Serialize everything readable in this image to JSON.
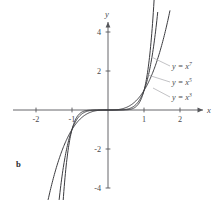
{
  "figure": {
    "panel_label": "b",
    "axis_x_name": "x",
    "axis_y_name": "y"
  },
  "chart_data": {
    "type": "line",
    "title": "",
    "subtitle": "",
    "xlabel": "x",
    "ylabel": "y",
    "xlim": [
      -2.6,
      2.45
    ],
    "ylim": [
      -5.2,
      5.1
    ],
    "grid": false,
    "legend_position": "right-inside",
    "xticks": [
      -2,
      -1,
      1,
      2
    ],
    "xtick_labels": [
      "-2",
      "-1",
      "1",
      "2"
    ],
    "yticks": [
      4,
      2,
      -2,
      -4
    ],
    "ytick_labels": [
      "4",
      "2",
      "-2",
      "-4"
    ],
    "series": [
      {
        "name": "y = x^7",
        "label_base": "y = x",
        "label_exponent": "7",
        "exponent": 7,
        "color": "#3b3b3f",
        "x": [
          -1.28,
          -1.24,
          -1.2,
          -1.15,
          -1.1,
          -1.05,
          -1.0,
          -0.95,
          -0.9,
          -0.8,
          -0.7,
          -0.6,
          -0.5,
          -0.4,
          -0.3,
          -0.2,
          -0.1,
          0,
          0.1,
          0.2,
          0.3,
          0.4,
          0.5,
          0.6,
          0.7,
          0.8,
          0.9,
          0.95,
          1.0,
          1.05,
          1.1,
          1.15,
          1.2,
          1.24,
          1.28
        ],
        "y": [
          -5.6,
          -4.5,
          -3.58,
          -2.66,
          -1.95,
          -1.41,
          -1.0,
          -0.7,
          -0.48,
          -0.21,
          -0.082,
          -0.028,
          -0.0078,
          -0.0016,
          -0.00022,
          -1.28e-05,
          0,
          0,
          0,
          1.28e-05,
          0.00022,
          0.0016,
          0.0078,
          0.028,
          0.082,
          0.21,
          0.48,
          0.7,
          1.0,
          1.41,
          1.95,
          2.66,
          3.58,
          4.5,
          5.6
        ]
      },
      {
        "name": "y = x^5",
        "label_base": "y = x",
        "label_exponent": "5",
        "exponent": 5,
        "color": "#3b3b3f",
        "x": [
          -1.38,
          -1.33,
          -1.28,
          -1.22,
          -1.16,
          -1.1,
          -1.05,
          -1.0,
          -0.95,
          -0.9,
          -0.8,
          -0.7,
          -0.6,
          -0.5,
          -0.4,
          -0.3,
          -0.2,
          -0.1,
          0,
          0.1,
          0.2,
          0.3,
          0.4,
          0.5,
          0.6,
          0.7,
          0.8,
          0.9,
          0.95,
          1.0,
          1.05,
          1.1,
          1.16,
          1.22,
          1.28,
          1.33,
          1.38
        ],
        "y": [
          -5.0,
          -4.16,
          -3.44,
          -2.71,
          -2.1,
          -1.61,
          -1.28,
          -1.0,
          -0.77,
          -0.59,
          -0.33,
          -0.17,
          -0.078,
          -0.031,
          -0.0102,
          -0.0024,
          -0.00032,
          -1e-05,
          0,
          1e-05,
          0.00032,
          0.0024,
          0.0102,
          0.031,
          0.078,
          0.17,
          0.33,
          0.59,
          0.77,
          1.0,
          1.28,
          1.61,
          2.1,
          2.71,
          3.44,
          4.16,
          5.0
        ]
      },
      {
        "name": "y = x^3",
        "label_base": "y = x",
        "label_exponent": "3",
        "exponent": 3,
        "color": "#3b3b3f",
        "x": [
          -1.72,
          -1.65,
          -1.58,
          -1.5,
          -1.4,
          -1.3,
          -1.2,
          -1.1,
          -1.0,
          -0.9,
          -0.8,
          -0.7,
          -0.6,
          -0.5,
          -0.4,
          -0.3,
          -0.2,
          -0.1,
          0,
          0.1,
          0.2,
          0.3,
          0.4,
          0.5,
          0.6,
          0.7,
          0.8,
          0.9,
          1.0,
          1.1,
          1.2,
          1.3,
          1.4,
          1.5,
          1.58,
          1.65,
          1.72
        ],
        "y": [
          -5.09,
          -4.49,
          -3.94,
          -3.38,
          -2.74,
          -2.2,
          -1.73,
          -1.33,
          -1.0,
          -0.73,
          -0.51,
          -0.34,
          -0.22,
          -0.125,
          -0.064,
          -0.027,
          -0.008,
          -0.001,
          0,
          0.001,
          0.008,
          0.027,
          0.064,
          0.125,
          0.22,
          0.34,
          0.51,
          0.73,
          1.0,
          1.33,
          1.73,
          2.2,
          2.74,
          3.38,
          3.94,
          4.49,
          5.09
        ]
      }
    ]
  }
}
